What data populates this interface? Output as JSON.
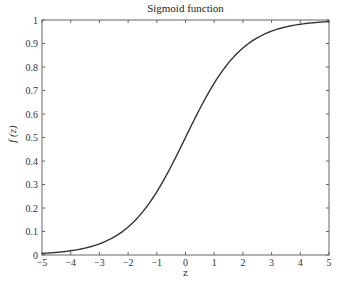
{
  "chart_data": {
    "type": "line",
    "title": "Sigmoid function",
    "xlabel": "z",
    "ylabel": "f (z)",
    "xlim": [
      -5,
      5
    ],
    "ylim": [
      0,
      1
    ],
    "xticks": [
      -5,
      -4,
      -3,
      -2,
      -1,
      0,
      1,
      2,
      3,
      4,
      5
    ],
    "yticks": [
      0,
      0.1,
      0.2,
      0.3,
      0.4,
      0.5,
      0.6,
      0.7,
      0.8,
      0.9,
      1
    ],
    "grid": false,
    "legend": null,
    "series": [
      {
        "name": "sigmoid",
        "function": "1/(1+exp(-z))",
        "x": [
          -5,
          -4,
          -3,
          -2,
          -1,
          0,
          1,
          2,
          3,
          4,
          5
        ],
        "y": [
          0.0067,
          0.018,
          0.047,
          0.119,
          0.269,
          0.5,
          0.731,
          0.881,
          0.953,
          0.982,
          0.9933
        ]
      }
    ],
    "line_color": "#333333"
  },
  "labels": {
    "title": "Sigmoid function",
    "xlabel": "z",
    "ylabel": "f (z)"
  }
}
